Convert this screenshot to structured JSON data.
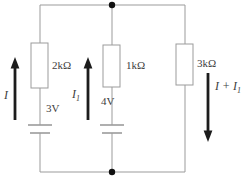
{
  "figure": {
    "background": "#ffffff"
  },
  "circuit": {
    "resistors": [
      {
        "label": "2kΩ"
      },
      {
        "label": "1kΩ"
      },
      {
        "label": "3kΩ"
      }
    ],
    "sources": [
      {
        "label": "3V"
      },
      {
        "label": "4V"
      }
    ],
    "currents": [
      {
        "base": "I",
        "subscript": "",
        "direction": "up"
      },
      {
        "base": "I",
        "subscript": "1",
        "direction": "up"
      },
      {
        "base": "I + I",
        "subscript": "1",
        "direction": "down"
      }
    ],
    "colors": {
      "wire": "#9b9b9b",
      "arrow": "#1c1c1c",
      "text": "#404040",
      "node": "#111111",
      "background": "#ffffff"
    }
  }
}
